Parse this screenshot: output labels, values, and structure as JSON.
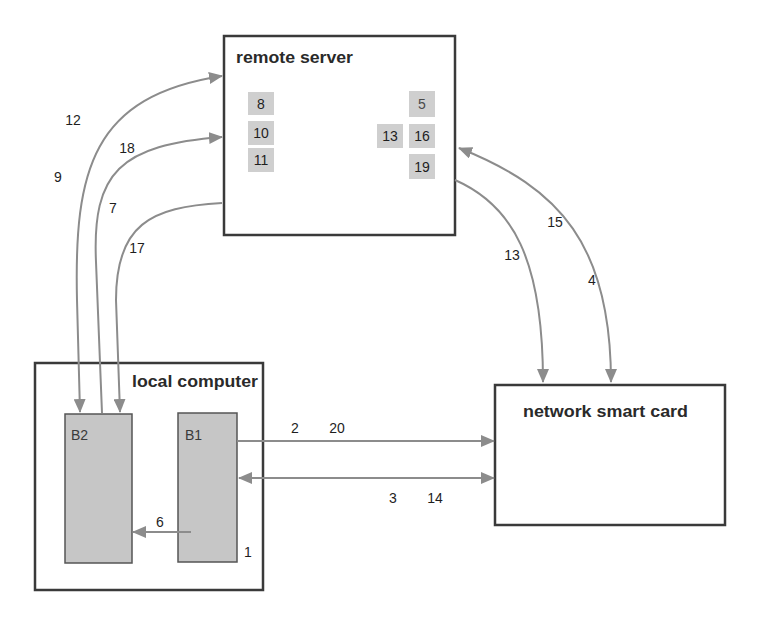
{
  "diagram": {
    "remote_server": {
      "label": "remote server",
      "left_steps": [
        "8",
        "10",
        "11"
      ],
      "right_steps": [
        "5",
        "16",
        "19"
      ],
      "middle_step": "13"
    },
    "local_computer": {
      "label": "local computer",
      "b2": {
        "label": "B2"
      },
      "b1": {
        "label": "B1"
      },
      "step": "1"
    },
    "network_smart_card": {
      "label": "network smart card"
    },
    "edges": [
      {
        "from": "B2",
        "to": "remote server",
        "direction": "bidirectional",
        "labels": [
          "12",
          "9"
        ]
      },
      {
        "from": "B2",
        "to": "remote server",
        "direction": "forward",
        "labels": [
          "18",
          "7"
        ]
      },
      {
        "from": "remote server",
        "to": "B2",
        "direction": "forward",
        "labels": [
          "17"
        ]
      },
      {
        "from": "remote server",
        "to": "network smart card",
        "direction": "forward",
        "labels": [
          "13"
        ]
      },
      {
        "from": "remote server",
        "to": "network smart card",
        "direction": "bidirectional",
        "labels": [
          "15",
          "4"
        ]
      },
      {
        "from": "B1",
        "to": "network smart card",
        "direction": "forward",
        "labels": [
          "2",
          "20"
        ]
      },
      {
        "from": "B1",
        "to": "network smart card",
        "direction": "bidirectional",
        "labels": [
          "3",
          "14"
        ]
      },
      {
        "from": "B1",
        "to": "B2",
        "direction": "forward",
        "labels": [
          "6"
        ]
      }
    ],
    "colors": {
      "frame_border": "#3a3a3a",
      "buffer_fill": "#c6c6c6",
      "step_fill": "#cfcfcf",
      "edge": "#8c8c8c"
    }
  }
}
